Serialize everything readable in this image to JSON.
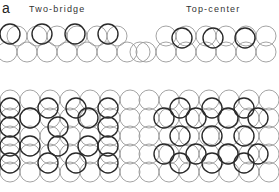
{
  "figure": {
    "panel_label": "a",
    "captions": [
      "Two-bridge",
      "Top-center"
    ],
    "colors": {
      "substrate": "#9a9a9a",
      "adsorbate": "#2a2a2a"
    },
    "radius": 10,
    "top_left": {
      "substrate_rows": [
        {
          "y": 36,
          "xs": [
            17,
            37,
            57,
            77,
            97,
            117
          ]
        },
        {
          "y": 52,
          "xs": [
            7,
            27,
            47,
            67,
            87,
            107,
            127,
            140
          ]
        }
      ],
      "adsorbates": {
        "y": 34,
        "xs": [
          10,
          42,
          75,
          108
        ]
      }
    },
    "top_right": {
      "substrate_rows": [
        {
          "y": 36,
          "xs": [
            166,
            186,
            206,
            226,
            246,
            266
          ]
        },
        {
          "y": 52,
          "xs": [
            146,
            166,
            186,
            206,
            226,
            246,
            266
          ]
        }
      ],
      "adsorbates": {
        "y": 38,
        "xs": [
          182,
          213,
          245
        ]
      }
    },
    "bottom_left": {
      "substrate_rows": [
        {
          "y": 100,
          "xs": [
            10,
            30,
            50,
            70,
            90,
            110,
            130
          ]
        },
        {
          "y": 118,
          "xs": [
            10,
            30,
            50,
            70,
            90,
            110,
            130
          ]
        },
        {
          "y": 136,
          "xs": [
            10,
            30,
            50,
            70,
            90,
            110,
            130
          ]
        },
        {
          "y": 154,
          "xs": [
            10,
            30,
            50,
            70,
            90,
            110,
            130
          ]
        },
        {
          "y": 172,
          "xs": [
            10,
            30,
            50,
            70,
            90,
            110,
            130
          ]
        }
      ],
      "adsorbates": [
        {
          "x": 10,
          "y": 108
        },
        {
          "x": 10,
          "y": 127
        },
        {
          "x": 10,
          "y": 146
        },
        {
          "x": 10,
          "y": 163
        },
        {
          "x": 30,
          "y": 118
        },
        {
          "x": 30,
          "y": 146
        },
        {
          "x": 48,
          "y": 108
        },
        {
          "x": 48,
          "y": 163
        },
        {
          "x": 58,
          "y": 127
        },
        {
          "x": 58,
          "y": 146
        },
        {
          "x": 76,
          "y": 108
        },
        {
          "x": 76,
          "y": 163
        },
        {
          "x": 88,
          "y": 118
        },
        {
          "x": 88,
          "y": 146
        },
        {
          "x": 108,
          "y": 108
        },
        {
          "x": 108,
          "y": 127
        },
        {
          "x": 108,
          "y": 146
        },
        {
          "x": 108,
          "y": 163
        }
      ]
    },
    "bottom_right": {
      "substrate_rows": [
        {
          "y": 100,
          "xs": [
            149,
            169,
            189,
            209,
            229,
            249,
            269
          ]
        },
        {
          "y": 118,
          "xs": [
            149,
            169,
            189,
            209,
            229,
            249,
            269
          ]
        },
        {
          "y": 136,
          "xs": [
            149,
            169,
            189,
            209,
            229,
            249,
            269
          ]
        },
        {
          "y": 154,
          "xs": [
            149,
            169,
            189,
            209,
            229,
            249,
            269
          ]
        },
        {
          "y": 172,
          "xs": [
            149,
            169,
            189,
            209,
            229,
            249,
            269
          ]
        }
      ],
      "adsorbates": [
        {
          "x": 180,
          "y": 108
        },
        {
          "x": 212,
          "y": 108
        },
        {
          "x": 244,
          "y": 108
        },
        {
          "x": 164,
          "y": 118
        },
        {
          "x": 196,
          "y": 118
        },
        {
          "x": 228,
          "y": 118
        },
        {
          "x": 258,
          "y": 118
        },
        {
          "x": 180,
          "y": 136
        },
        {
          "x": 212,
          "y": 136
        },
        {
          "x": 244,
          "y": 136
        },
        {
          "x": 164,
          "y": 154
        },
        {
          "x": 196,
          "y": 154
        },
        {
          "x": 228,
          "y": 154
        },
        {
          "x": 258,
          "y": 154
        },
        {
          "x": 180,
          "y": 163
        },
        {
          "x": 212,
          "y": 163
        },
        {
          "x": 244,
          "y": 163
        }
      ]
    }
  }
}
